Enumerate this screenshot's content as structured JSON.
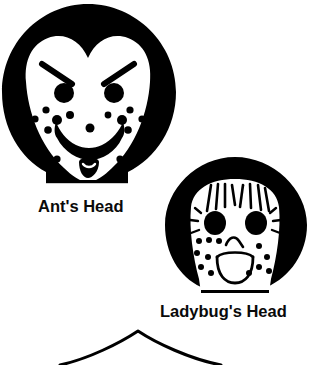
{
  "page": {
    "background_color": "#ffffff",
    "ink_color": "#000000",
    "width": 314,
    "height": 361
  },
  "figures": [
    {
      "id": "ants-head",
      "caption": "Ant's Head",
      "description": "black circular hair silhouette with white heart-shaped face",
      "features": [
        "slanted-eyebrows",
        "round-black-eyes",
        "freckle-dots",
        "wide-smiling-mouth",
        "flat-chin-line"
      ]
    },
    {
      "id": "ladybugs-head",
      "caption": "Ladybug's Head",
      "description": "black circular hair silhouette with white face, bangs and eyelashes",
      "features": [
        "bangs-strands",
        "eyes-with-eyelashes",
        "freckle-dots",
        "outlined-frowning-mouth",
        "flat-chin-line"
      ]
    },
    {
      "id": "third-head",
      "caption": "",
      "description": "thin outlined peak shape cropped at the bottom edge of the image",
      "features": [
        "outline-arc-peak"
      ]
    }
  ]
}
